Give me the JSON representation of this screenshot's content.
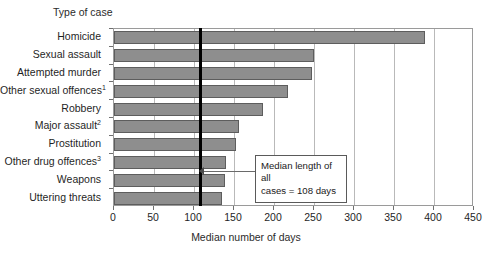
{
  "chart_data": {
    "type": "bar",
    "orientation": "horizontal",
    "title": "",
    "ylabel": "Type of case",
    "xlabel": "Median number of days",
    "xlim": [
      0,
      450
    ],
    "xticks": [
      0,
      50,
      100,
      150,
      200,
      250,
      300,
      350,
      400,
      450
    ],
    "grid": true,
    "legend": "none",
    "categories": [
      "Homicide",
      "Sexual assault",
      "Attempted murder",
      "Other sexual offences",
      "Robbery",
      "Major assault",
      "Prostitution",
      "Other drug offences",
      "Weapons",
      "Uttering threats"
    ],
    "category_footnotes": [
      "",
      "",
      "",
      "1",
      "",
      "2",
      "",
      "3",
      "",
      ""
    ],
    "values": [
      389,
      250,
      248,
      218,
      186,
      156,
      153,
      140,
      139,
      135
    ],
    "reference_line": {
      "value": 108,
      "label_line1": "Median length of all",
      "label_line2": "cases = 108 days"
    },
    "colors": {
      "bar_fill": "#8e8e8e",
      "bar_stroke": "#5d5d5d",
      "reference_line": "#000000",
      "grid": "#b9b9b9",
      "frame": "#9a9a9a"
    }
  }
}
